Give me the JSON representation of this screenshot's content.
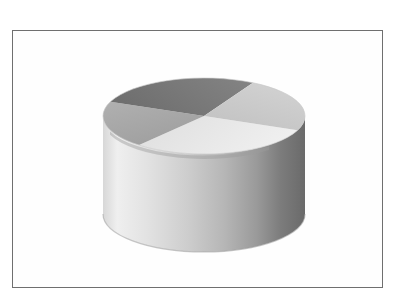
{
  "figure": {
    "background_color": "#ffffff",
    "frame": {
      "border_color": "#6f6f6f",
      "fill_color": "#fefefe",
      "x": 12,
      "y": 30,
      "width": 371,
      "height": 258
    }
  },
  "chart_data": {
    "type": "pie",
    "title": "",
    "subtitle": "",
    "xlabel": "",
    "ylabel": "",
    "legend": [],
    "annotations": [],
    "grid": false,
    "style": "3d-cylinder-pie",
    "center": {
      "x": 204,
      "y": 116
    },
    "radius_x": 101,
    "radius_y": 38,
    "depth": 98,
    "start_angle_deg": 22,
    "direction": "clockwise",
    "categories": [
      "Slice 1",
      "Slice 2",
      "Slice 3",
      "Slice 4"
    ],
    "values": [
      30,
      20,
      27,
      23
    ],
    "percentages": [
      30,
      20,
      27,
      23
    ],
    "labels_visible": false,
    "slices": [
      {
        "name": "Slice 1",
        "value": 30,
        "percent": 30,
        "start_angle_deg": 22,
        "end_angle_deg": 130,
        "top_color": "#e8e8e8",
        "side_color_light": "#efefef",
        "side_color_dark": "#bdbdbd",
        "position": "right"
      },
      {
        "name": "Slice 2",
        "value": 20,
        "percent": 20,
        "start_angle_deg": 130,
        "end_angle_deg": 202,
        "top_color": "#a8a8a8",
        "side_color_light": "#b4b4b4",
        "side_color_dark": "#8a8a8a",
        "position": "bottom-front"
      },
      {
        "name": "Slice 3",
        "value": 27,
        "percent": 27,
        "start_angle_deg": 202,
        "end_angle_deg": 299,
        "top_color": "#787878",
        "side_color_light": "#8f8f8f",
        "side_color_dark": "#6b6b6b",
        "position": "left"
      },
      {
        "name": "Slice 4",
        "value": 23,
        "percent": 23,
        "start_angle_deg": 299,
        "end_angle_deg": 382,
        "top_color": "#c9c9c9",
        "side_color_light": "#d4d4d4",
        "side_color_dark": "#a0a0a0",
        "position": "top"
      }
    ],
    "wall_gradient": {
      "left_color": "#efefef",
      "mid_color": "#c4c4c4",
      "right_color": "#6e6e6e"
    },
    "ylim": [
      0,
      0
    ],
    "xlim": [
      0,
      0
    ]
  }
}
